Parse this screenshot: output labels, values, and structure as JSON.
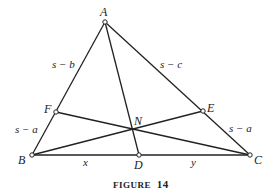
{
  "figure": {
    "caption_word": "FIGURE",
    "caption_number": "14",
    "line_color": "#222222",
    "point_fill": "#ffffff"
  },
  "points": {
    "A": {
      "label": "A",
      "x": 105,
      "y": 22
    },
    "B": {
      "label": "B",
      "x": 32,
      "y": 155
    },
    "C": {
      "label": "C",
      "x": 250,
      "y": 155
    },
    "D": {
      "label": "D",
      "x": 139,
      "y": 155
    },
    "E": {
      "label": "E",
      "x": 203,
      "y": 111
    },
    "F": {
      "label": "F",
      "x": 56,
      "y": 112
    },
    "N": {
      "label": "N",
      "x": 133,
      "y": 129
    }
  },
  "segment_labels": {
    "AF": "s − b",
    "AE": "s − c",
    "FB": "s − a",
    "EC": "s − a",
    "BD": "x",
    "DC": "y"
  }
}
